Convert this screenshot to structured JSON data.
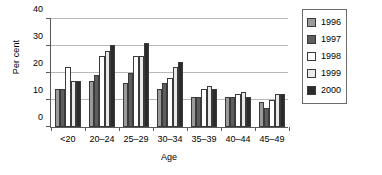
{
  "chart_data": {
    "type": "bar",
    "title": "",
    "xlabel": "Age",
    "ylabel": "Per cent",
    "categories": [
      "<20",
      "20–24",
      "25–29",
      "30–34",
      "35–39",
      "40–44",
      "45–49"
    ],
    "ylim": [
      0,
      40
    ],
    "yticks": [
      0,
      10,
      20,
      30,
      40
    ],
    "ytick_labels": [
      "0",
      "10",
      "20",
      "30",
      "40"
    ],
    "grid": true,
    "legend_position": "right-outside",
    "series": [
      {
        "name": "1996",
        "color": "#9a9a9a",
        "values": [
          14,
          17,
          16,
          14,
          11,
          11,
          9
        ]
      },
      {
        "name": "1997",
        "color": "#5e5e5e",
        "values": [
          14,
          19,
          20,
          16,
          11,
          11,
          7
        ]
      },
      {
        "name": "1998",
        "color": "#ffffff",
        "values": [
          22,
          26,
          26,
          18,
          14,
          12,
          10
        ]
      },
      {
        "name": "1999",
        "color": "#e9e9e9",
        "values": [
          17,
          28,
          26,
          22,
          15,
          13,
          12
        ]
      },
      {
        "name": "2000",
        "color": "#2b2b2b",
        "values": [
          17,
          30,
          31,
          24,
          14,
          11,
          12
        ]
      }
    ]
  }
}
